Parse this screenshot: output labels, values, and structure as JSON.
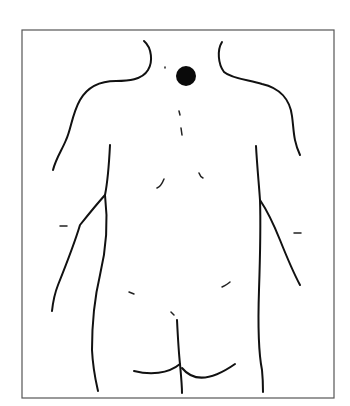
{
  "figure": {
    "type": "body-diagram",
    "view": "posterior torso (back view)",
    "marker": {
      "shape": "filled-circle",
      "location": "base of neck / upper back, midline",
      "color": "#0a0a0a",
      "cx": 186,
      "cy": 76,
      "r": 10
    },
    "frame_color": "#555555",
    "line_color": "#111111",
    "background": "#ffffff"
  }
}
